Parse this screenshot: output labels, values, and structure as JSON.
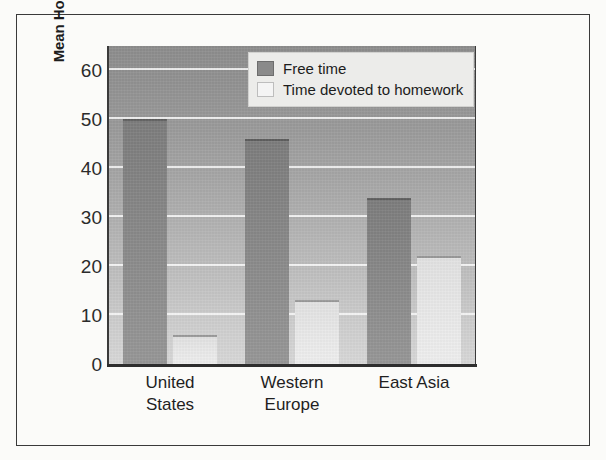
{
  "chart_data": {
    "type": "bar",
    "title": "",
    "xlabel": "",
    "ylabel": "Mean Hours per Week",
    "categories": [
      "United States",
      "Western Europe",
      "East Asia"
    ],
    "category_lines": [
      [
        "United",
        "States"
      ],
      [
        "Western",
        "Europe"
      ],
      [
        "East Asia"
      ]
    ],
    "series": [
      {
        "name": "Free time",
        "values": [
          50,
          46,
          34
        ],
        "color": "#8a8a8a"
      },
      {
        "name": "Time devoted to homework",
        "values": [
          6,
          13,
          22
        ],
        "color": "#f4f4f4"
      }
    ],
    "ylim": [
      0,
      65
    ],
    "yticks": [
      0,
      10,
      20,
      30,
      40,
      50,
      60
    ],
    "ytick_labels": [
      "0",
      "10",
      "20",
      "30",
      "40",
      "50",
      "60"
    ],
    "grid": true,
    "grid_axis": "y",
    "legend_position": "top-right",
    "legend_entries": [
      "Free time",
      "Time devoted to homework"
    ]
  },
  "legend": {
    "items": [
      {
        "label": "Free time",
        "swatch": "free-time-swatch"
      },
      {
        "label": "Time devoted to homework",
        "swatch": "homework-swatch"
      }
    ]
  },
  "axes": {
    "y_title": "Mean Hours per Week"
  }
}
